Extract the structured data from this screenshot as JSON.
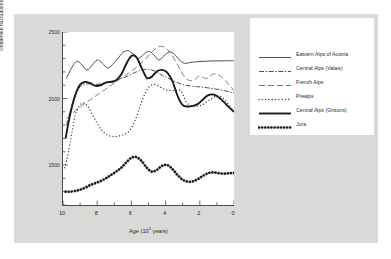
{
  "chart_data": {
    "type": "line",
    "title": "",
    "xlabel": "Age (10³ years)",
    "ylabel": "Timberline fluctuations (m)",
    "xlim": [
      10,
      0
    ],
    "ylim": [
      1200,
      2500
    ],
    "x_ticks": [
      "10",
      "8",
      "6",
      "4",
      "2",
      "0"
    ],
    "x_tick_values": [
      10,
      8,
      6,
      4,
      2,
      0
    ],
    "y_ticks": [
      "1500",
      "2000",
      "2500"
    ],
    "y_tick_values": [
      1500,
      2000,
      2500
    ],
    "x_axis_reversed": true,
    "grid": false,
    "legend_position": "right",
    "series": [
      {
        "name": "Eastern Alps of Austria",
        "style": "thin-solid",
        "color": "#3c3c3c",
        "x": [
          9.8,
          9.5,
          9.2,
          8.9,
          8.6,
          8.3,
          8.0,
          7.7,
          7.4,
          7.1,
          6.8,
          6.5,
          6.2,
          5.9,
          5.6,
          5.3,
          5.0,
          4.7,
          4.4,
          4.1,
          3.8,
          3.5,
          3.2,
          2.9,
          2.6,
          2.3,
          2.0,
          1.7,
          1.4,
          1.1,
          0.8,
          0.5,
          0.2,
          0.0
        ],
        "y": [
          2150,
          2230,
          2280,
          2255,
          2215,
          2250,
          2290,
          2265,
          2230,
          2255,
          2300,
          2345,
          2360,
          2335,
          2300,
          2330,
          2355,
          2330,
          2290,
          2320,
          2350,
          2335,
          2290,
          2265,
          2270,
          2275,
          2278,
          2280,
          2282,
          2283,
          2283,
          2284,
          2284,
          2284
        ]
      },
      {
        "name": "Central Alps (Valais)",
        "style": "dash-dot",
        "color": "#3c3c3c",
        "x": [
          9.8,
          9.4,
          9.0,
          8.6,
          8.2,
          7.8,
          7.4,
          7.0,
          6.6,
          6.2,
          5.8,
          5.4,
          5.0,
          4.6,
          4.2,
          3.8,
          3.4,
          3.0,
          2.6,
          2.2,
          1.8,
          1.4,
          1.0,
          0.6,
          0.2,
          0.0
        ],
        "y": [
          1800,
          1980,
          2090,
          2110,
          2105,
          2110,
          2125,
          2135,
          2150,
          2170,
          2195,
          2215,
          2220,
          2205,
          2175,
          2150,
          2125,
          2105,
          2095,
          2090,
          2085,
          2078,
          2070,
          2060,
          2048,
          2042
        ]
      },
      {
        "name": "French Alps",
        "style": "long-dash",
        "color": "#6e6e6e",
        "x": [
          9.8,
          9.3,
          8.8,
          8.3,
          7.8,
          7.3,
          6.8,
          6.3,
          5.8,
          5.3,
          4.8,
          4.4,
          4.0,
          3.6,
          3.2,
          2.8,
          2.4,
          2.0,
          1.6,
          1.2,
          0.8,
          0.4,
          0.0
        ],
        "y": [
          1850,
          1905,
          1955,
          2000,
          2045,
          2090,
          2135,
          2180,
          2225,
          2280,
          2350,
          2390,
          2380,
          2320,
          2230,
          2150,
          2135,
          2170,
          2150,
          2185,
          2170,
          2120,
          2060
        ]
      },
      {
        "name": "Prealps",
        "style": "fine-dot",
        "color": "#3c3c3c",
        "x": [
          9.9,
          9.8,
          9.7,
          9.6,
          9.5,
          9.4,
          9.3,
          9.1,
          8.9,
          8.7,
          8.5,
          8.2,
          7.9,
          7.6,
          7.3,
          7.0,
          6.7,
          6.4,
          6.1,
          5.8,
          5.5,
          5.2,
          4.9,
          4.6,
          4.3,
          4.0,
          3.7,
          3.4,
          3.1,
          2.8,
          2.5,
          2.2,
          1.9,
          1.6,
          1.3,
          1.0,
          0.7,
          0.4,
          0.1
        ],
        "y": [
          1480,
          1530,
          1590,
          1660,
          1730,
          1800,
          1870,
          1930,
          1965,
          1960,
          1930,
          1860,
          1790,
          1745,
          1720,
          1715,
          1720,
          1730,
          1760,
          1830,
          1940,
          2040,
          2095,
          2105,
          2085,
          2065,
          2060,
          2060,
          2058,
          1975,
          1945,
          1940,
          1950,
          1975,
          2000,
          2020,
          2010,
          1970,
          1910
        ]
      },
      {
        "name": "Central Alps (Grisons)",
        "style": "thick-solid",
        "color": "#1c1c1c",
        "x": [
          9.85,
          9.6,
          9.3,
          9.0,
          8.7,
          8.4,
          8.1,
          7.8,
          7.5,
          7.2,
          6.9,
          6.6,
          6.3,
          6.0,
          5.7,
          5.4,
          5.1,
          4.8,
          4.5,
          4.2,
          3.9,
          3.6,
          3.3,
          3.0,
          2.7,
          2.4,
          2.1,
          1.8,
          1.5,
          1.2,
          0.9,
          0.6,
          0.3,
          0.0
        ],
        "y": [
          1700,
          1870,
          2020,
          2105,
          2125,
          2115,
          2095,
          2100,
          2120,
          2125,
          2135,
          2180,
          2260,
          2320,
          2310,
          2230,
          2155,
          2165,
          2205,
          2215,
          2195,
          2130,
          2020,
          1950,
          1940,
          1945,
          1960,
          1995,
          2025,
          2030,
          2010,
          1975,
          1935,
          1900
        ]
      },
      {
        "name": "Jura",
        "style": "thick-dot",
        "color": "#1c1c1c",
        "x": [
          9.85,
          9.6,
          9.3,
          9.0,
          8.7,
          8.4,
          8.1,
          7.8,
          7.5,
          7.2,
          6.9,
          6.6,
          6.3,
          6.0,
          5.7,
          5.4,
          5.1,
          4.8,
          4.5,
          4.2,
          3.9,
          3.6,
          3.3,
          3.0,
          2.7,
          2.4,
          2.1,
          1.8,
          1.5,
          1.2,
          0.9,
          0.6,
          0.3,
          0.0
        ],
        "y": [
          1300,
          1300,
          1305,
          1315,
          1330,
          1350,
          1365,
          1380,
          1400,
          1425,
          1450,
          1480,
          1520,
          1555,
          1560,
          1530,
          1480,
          1450,
          1465,
          1495,
          1500,
          1470,
          1425,
          1390,
          1375,
          1378,
          1395,
          1420,
          1440,
          1445,
          1440,
          1435,
          1438,
          1442
        ]
      }
    ]
  },
  "legend": {
    "entries": [
      {
        "label": "Eastern Alps of Austria",
        "style": "thin-solid"
      },
      {
        "label": "Central Alps (Valais)",
        "style": "dash-dot"
      },
      {
        "label": "French Alps",
        "style": "long-dash"
      },
      {
        "label": "Prealps",
        "style": "fine-dot"
      },
      {
        "label": "Central Alps (Grisons)",
        "style": "thick-solid"
      },
      {
        "label": "Jura",
        "style": "thick-dot"
      }
    ]
  },
  "axes": {
    "y_title": "Timberline fluctuations (m)",
    "x_title_prefix": "Age (10",
    "x_title_sup": "3",
    "x_title_suffix": " years)"
  }
}
